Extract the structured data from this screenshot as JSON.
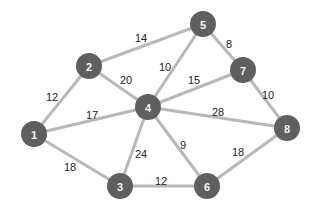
{
  "graph": {
    "colors": {
      "node": "#5f5f5f",
      "edge": "#b8b8b8",
      "node_text": "#f4f4f4",
      "weight_text": "#222222"
    },
    "nodes": [
      {
        "id": "1",
        "label": "1"
      },
      {
        "id": "2",
        "label": "2"
      },
      {
        "id": "3",
        "label": "3"
      },
      {
        "id": "4",
        "label": "4"
      },
      {
        "id": "5",
        "label": "5"
      },
      {
        "id": "6",
        "label": "6"
      },
      {
        "id": "7",
        "label": "7"
      },
      {
        "id": "8",
        "label": "8"
      }
    ],
    "edges": [
      {
        "from": "1",
        "to": "2",
        "weight": "12"
      },
      {
        "from": "2",
        "to": "5",
        "weight": "14"
      },
      {
        "from": "2",
        "to": "4",
        "weight": "20"
      },
      {
        "from": "1",
        "to": "4",
        "weight": "17"
      },
      {
        "from": "1",
        "to": "3",
        "weight": "18"
      },
      {
        "from": "4",
        "to": "5",
        "weight": "10"
      },
      {
        "from": "5",
        "to": "7",
        "weight": "8"
      },
      {
        "from": "4",
        "to": "7",
        "weight": "15"
      },
      {
        "from": "7",
        "to": "8",
        "weight": "10"
      },
      {
        "from": "4",
        "to": "8",
        "weight": "28"
      },
      {
        "from": "4",
        "to": "3",
        "weight": "24"
      },
      {
        "from": "4",
        "to": "6",
        "weight": "9"
      },
      {
        "from": "3",
        "to": "6",
        "weight": "12"
      },
      {
        "from": "6",
        "to": "8",
        "weight": "18"
      }
    ]
  }
}
